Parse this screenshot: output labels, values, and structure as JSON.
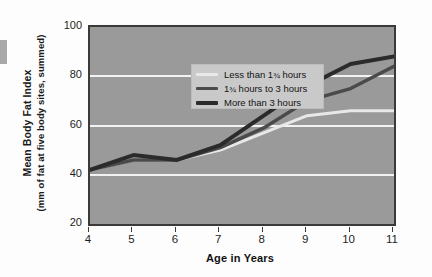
{
  "chart_data": {
    "type": "line",
    "title": "",
    "xlabel": "Age in Years",
    "ylabel": "Mean Body Fat Index (mm of fat at five body sites, summed)",
    "ylabel_line1": "Mean Body Fat Index",
    "ylabel_line2": "(mm of fat at five body sites, summed)",
    "x": [
      4,
      5,
      6,
      7,
      8,
      9,
      10,
      11
    ],
    "xtick_labels": [
      "4",
      "5",
      "6",
      "7",
      "8",
      "9",
      "10",
      "11"
    ],
    "ytick_labels": [
      "100",
      "80",
      "60",
      "40",
      "20"
    ],
    "yticks": [
      100,
      80,
      60,
      40,
      20
    ],
    "ylim": [
      20,
      100
    ],
    "xlim": [
      4,
      11
    ],
    "grid": "horizontal",
    "legend_position": "top-left-inside",
    "series": [
      {
        "name": "Less than 1¾ hours",
        "color": "#e8e8e8",
        "width": 3.0,
        "values": [
          42,
          46,
          46,
          50,
          57,
          64,
          66,
          66
        ]
      },
      {
        "name": "1¾ hours to 3 hours",
        "color": "#4a4a4a",
        "width": 3.5,
        "values": [
          42,
          46,
          46,
          51,
          59,
          70,
          75,
          84
        ]
      },
      {
        "name": "More than 3 hours",
        "color": "#2b2b2b",
        "width": 4.0,
        "values": [
          42,
          48,
          46,
          52,
          64,
          76,
          85,
          88
        ]
      }
    ]
  },
  "legend": {
    "items": [
      {
        "label_pre": "Less than 1",
        "frac": "¾",
        "label_post": " hours",
        "full": "Less than 1¾ hours"
      },
      {
        "label_pre": "1",
        "frac": "¾",
        "label_post": " hours to 3 hours",
        "full": "1¾ hours to 3 hours"
      },
      {
        "label_pre": "More than 3 hours",
        "frac": "",
        "label_post": "",
        "full": "More than 3 hours"
      }
    ]
  },
  "colors": {
    "plot_background": "#9a9a9a",
    "plot_border": "#3a3a3a",
    "gridline": "#f2f2f2",
    "legend_background": "#c9c9c9",
    "page_background": "#fdfdfd",
    "series_light": "#e8e8e8",
    "series_mid": "#4a4a4a",
    "series_dark": "#2b2b2b"
  }
}
